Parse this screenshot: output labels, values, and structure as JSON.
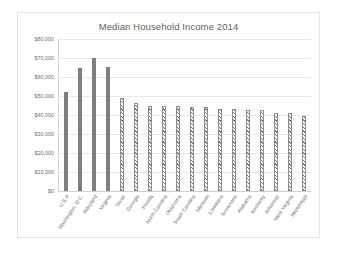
{
  "chart_data": {
    "type": "bar",
    "title": "Median Household Income 2014",
    "xlabel": "",
    "ylabel": "",
    "ylim": [
      0,
      80000
    ],
    "ytick_labels": [
      "$80,000",
      "$70,000",
      "$60,000",
      "$50,000",
      "$40,000",
      "$30,000",
      "$20,000",
      "$10,000",
      "$0"
    ],
    "ytick_values": [
      80000,
      70000,
      60000,
      50000,
      40000,
      30000,
      20000,
      10000,
      0
    ],
    "grid": true,
    "legend": false,
    "categories": [
      "U.S.A",
      "Washington, D.C.",
      "Maryland",
      "Virginia",
      "Texas",
      "Georgia",
      "Florida",
      "North Carolina",
      "Oklahoma",
      "South Carolina",
      "Missouri",
      "Louisiana",
      "Tennessee",
      "Alabama",
      "Kentucky",
      "Arkansas",
      "West Virginia",
      "Mississippi"
    ],
    "values": [
      52000,
      65000,
      70000,
      65500,
      49000,
      46500,
      44500,
      45000,
      45000,
      44000,
      44000,
      43000,
      43000,
      42500,
      42500,
      41000,
      41000,
      39500
    ],
    "bar_styles": [
      "solid",
      "solid",
      "solid",
      "solid",
      "hatched",
      "hatched",
      "hatched",
      "hatched",
      "hatched",
      "hatched",
      "hatched",
      "hatched",
      "hatched",
      "hatched",
      "hatched",
      "hatched",
      "hatched",
      "hatched"
    ],
    "colors": {
      "solid_bar": "#7f7f7f",
      "hatch_line": "#7d7d7d",
      "hatch_background": "#ffffff",
      "gridline": "#e9e9e9",
      "text": "#6e6e6e",
      "frame_border": "#e3e3e3"
    }
  }
}
